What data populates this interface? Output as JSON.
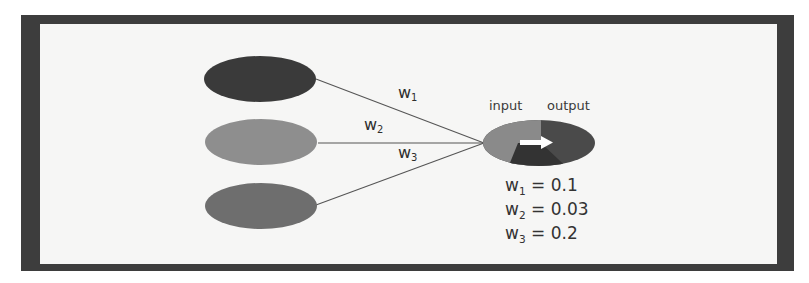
{
  "diagram": {
    "type": "single-neuron-weighted-inputs",
    "colors": {
      "frame": "#3d3d3d",
      "background": "#f6f6f5",
      "input_node_1": "#3a3a3a",
      "input_node_2": "#8e8e8e",
      "input_node_3": "#6e6e6e",
      "output_input_half": "#8a8a8a",
      "output_output_half": "#4a4a4a",
      "output_lower_wedge": "#333333",
      "arrow": "#ffffff",
      "edge": "#555555"
    },
    "input_nodes": [
      {
        "id": "x1"
      },
      {
        "id": "x2"
      },
      {
        "id": "x3"
      }
    ],
    "edges": [
      {
        "var": "w",
        "index": "1"
      },
      {
        "var": "w",
        "index": "2"
      },
      {
        "var": "w",
        "index": "3"
      }
    ],
    "output_node": {
      "input_label": "input",
      "output_label": "output",
      "arrow_icon": "right-arrow"
    },
    "weights": [
      {
        "var": "w",
        "index": "1",
        "eq": "= 0.1",
        "value": 0.1
      },
      {
        "var": "w",
        "index": "2",
        "eq": "= 0.03",
        "value": 0.03
      },
      {
        "var": "w",
        "index": "3",
        "eq": "= 0.2",
        "value": 0.2
      }
    ]
  }
}
